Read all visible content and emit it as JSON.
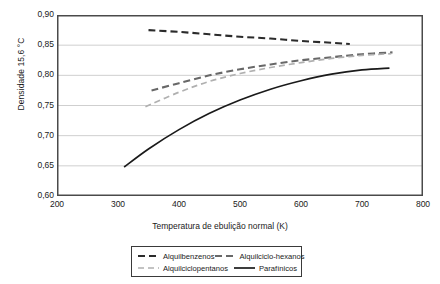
{
  "chart_data": {
    "type": "line",
    "title": "",
    "xlabel": "Temperatura de ebulição normal (K)",
    "ylabel": "Densidade 15,6 °C",
    "xlim": [
      200,
      800
    ],
    "ylim": [
      0.6,
      0.9
    ],
    "xticks": [
      200,
      300,
      400,
      500,
      600,
      700,
      800
    ],
    "xtick_labels": [
      "200",
      "300",
      "400",
      "500",
      "600",
      "700",
      "800"
    ],
    "yticks": [
      0.6,
      0.65,
      0.7,
      0.75,
      0.8,
      0.85,
      0.9
    ],
    "ytick_labels": [
      "0,60",
      "0,65",
      "0,70",
      "0,75",
      "0,80",
      "0,85",
      "0,90"
    ],
    "grid": "horizontal",
    "legend_position": "below",
    "series": [
      {
        "name": "Alquilbenzenos",
        "style": "dashed",
        "color": "#2b2b2b",
        "width": 2.1,
        "dash": "7,4",
        "x": [
          350,
          400,
          450,
          500,
          550,
          600,
          650,
          680
        ],
        "y": [
          0.875,
          0.872,
          0.868,
          0.864,
          0.861,
          0.857,
          0.854,
          0.852
        ]
      },
      {
        "name": "Alquilciclo-hexanos",
        "style": "dashed",
        "color": "#686868",
        "width": 2.1,
        "dash": "7,4",
        "x": [
          355,
          400,
          450,
          500,
          550,
          600,
          650,
          700,
          750
        ],
        "y": [
          0.775,
          0.787,
          0.8,
          0.81,
          0.818,
          0.825,
          0.83,
          0.835,
          0.838
        ]
      },
      {
        "name": "Alquilciclopentanos",
        "style": "dashed",
        "color": "#b0b0b0",
        "width": 1.7,
        "dash": "6,4",
        "x": [
          345,
          400,
          450,
          500,
          550,
          600,
          650,
          700,
          748
        ],
        "y": [
          0.748,
          0.772,
          0.79,
          0.803,
          0.813,
          0.821,
          0.828,
          0.833,
          0.836
        ]
      },
      {
        "name": "Parafínicos",
        "style": "solid",
        "color": "#1a1a1a",
        "width": 1.7,
        "dash": "",
        "x": [
          310,
          350,
          400,
          450,
          500,
          550,
          600,
          650,
          700,
          745
        ],
        "y": [
          0.648,
          0.678,
          0.71,
          0.737,
          0.759,
          0.777,
          0.791,
          0.802,
          0.809,
          0.812
        ]
      }
    ]
  },
  "legend": {
    "entries": [
      {
        "label": "Alquilbenzenos"
      },
      {
        "label": "Alquilciclo-hexanos"
      },
      {
        "label": "Alquilciclopentanos"
      },
      {
        "label": "Parafínicos"
      }
    ]
  },
  "colors": {
    "axis": "#4a4a4a",
    "grid": "#cfcfcf",
    "legend_border": "#3a3a3a",
    "background": "#ffffff"
  }
}
